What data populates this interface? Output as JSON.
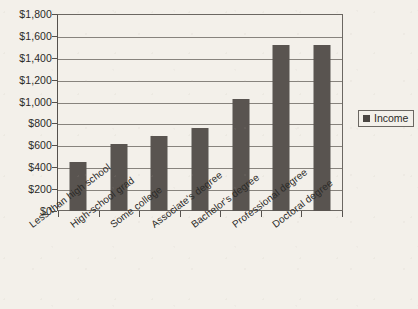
{
  "chart_data": {
    "type": "bar",
    "title": "",
    "xlabel": "",
    "ylabel": "",
    "categories": [
      "Less than high school",
      "High-school grad",
      "Some college",
      "Associate's degree",
      "Bachelor's degree",
      "Professional degree",
      "Doctoral degree"
    ],
    "series": [
      {
        "name": "Income",
        "values": [
          448,
          620,
          685,
          758,
          1032,
          1526,
          1526
        ]
      }
    ],
    "ylim": [
      0,
      1800
    ],
    "ytick_values": [
      0,
      200,
      400,
      600,
      800,
      1000,
      1200,
      1400,
      1600,
      1800
    ],
    "ytick_labels": [
      "$0",
      "$200",
      "$400",
      "$600",
      "$800",
      "$1,000",
      "$1,200",
      "$1,400",
      "$1,600",
      "$1,800"
    ],
    "grid": true,
    "legend": {
      "position": "right",
      "entries": [
        {
          "label": "Income",
          "color": "#4a4642"
        }
      ]
    },
    "colors": {
      "bar": "#595450",
      "background": "#f3f0ea",
      "gridline": "#87837d",
      "axis": "#55514d",
      "text": "#2b2a28"
    }
  }
}
